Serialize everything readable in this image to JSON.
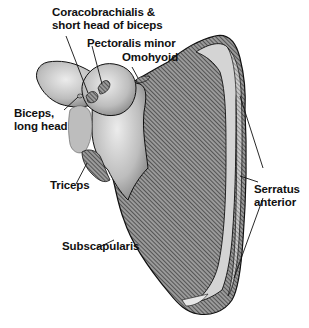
{
  "diagram": {
    "colors": {
      "ink": "#111111",
      "bone_light": "#d8d8d8",
      "bone_mid": "#a9a9a9",
      "hatch_dark": "#3a3a3a",
      "background": "#ffffff"
    },
    "labels": [
      {
        "id": "coracobrachialis",
        "text": "Coracobrachialis &\nshort head of biceps"
      },
      {
        "id": "pectoralis-minor",
        "text": "Pectoralis minor"
      },
      {
        "id": "omohyoid",
        "text": "Omohyoid"
      },
      {
        "id": "biceps-long-head",
        "text": "Biceps,\nlong head"
      },
      {
        "id": "triceps",
        "text": "Triceps"
      },
      {
        "id": "subscapularis",
        "text": "Subscapularis"
      },
      {
        "id": "serratus-anterior",
        "text": "Serratus\nanterior"
      }
    ]
  }
}
